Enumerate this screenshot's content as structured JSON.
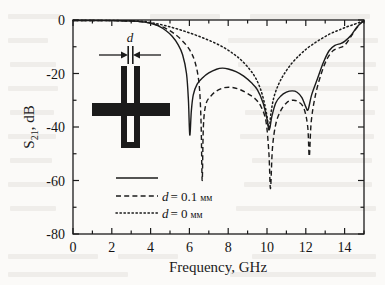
{
  "figure": {
    "background_color": "#fbfaf8",
    "ink_color": "#1b1b1b"
  },
  "axes": {
    "x_title": "Frequency, GHz",
    "y_title_main": "S",
    "y_title_sub": "21",
    "y_title_rest": ", dB",
    "x_ticks": [
      "0",
      "2",
      "4",
      "6",
      "8",
      "10",
      "12",
      "14"
    ],
    "y_ticks": [
      "0",
      "-20",
      "-40",
      "-60",
      "-80"
    ]
  },
  "legend": {
    "items": [
      {
        "style": "solid",
        "label": "",
        "units": ""
      },
      {
        "style": "dashed",
        "label": "d = 0.1",
        "units": "мм",
        "var": "d",
        "eq": "= 0.1"
      },
      {
        "style": "dotted",
        "label": "d = 0",
        "units": "мм",
        "var": "d",
        "eq": "= 0"
      }
    ]
  },
  "inset": {
    "dimension_label": "d",
    "description": "cross-shaped microstrip resonator with slot of width d"
  },
  "chart_data": {
    "type": "line",
    "title": "",
    "xlabel": "Frequency, GHz",
    "ylabel": "S21, dB",
    "xlim": [
      0,
      15
    ],
    "ylim": [
      -80,
      0
    ],
    "xticks": [
      0,
      2,
      4,
      6,
      8,
      10,
      12,
      14
    ],
    "yticks": [
      0,
      -20,
      -40,
      -60,
      -80
    ],
    "xminorticks": [
      1,
      3,
      5,
      7,
      9,
      11,
      13,
      15
    ],
    "yminorticks": [
      -10,
      -30,
      -50,
      -70
    ],
    "grid": false,
    "legend_position": "lower-left-inside",
    "series": [
      {
        "name": "solid",
        "label": "",
        "style": "solid",
        "points": [
          [
            0.0,
            -0.2
          ],
          [
            1.0,
            -0.2
          ],
          [
            2.0,
            -0.25
          ],
          [
            3.0,
            -0.4
          ],
          [
            3.5,
            -0.6
          ],
          [
            4.0,
            -1.2
          ],
          [
            4.4,
            -2.2
          ],
          [
            4.8,
            -4.0
          ],
          [
            5.1,
            -6.0
          ],
          [
            5.4,
            -9.0
          ],
          [
            5.65,
            -13.0
          ],
          [
            5.85,
            -20.0
          ],
          [
            5.95,
            -30.0
          ],
          [
            6.02,
            -43.0
          ],
          [
            6.1,
            -34.0
          ],
          [
            6.2,
            -28.0
          ],
          [
            6.4,
            -24.0
          ],
          [
            6.7,
            -21.5
          ],
          [
            7.0,
            -19.8
          ],
          [
            7.4,
            -18.4
          ],
          [
            7.7,
            -18.0
          ],
          [
            8.0,
            -18.3
          ],
          [
            8.4,
            -19.3
          ],
          [
            8.8,
            -21.0
          ],
          [
            9.2,
            -23.5
          ],
          [
            9.5,
            -26.0
          ],
          [
            9.8,
            -31.0
          ],
          [
            10.0,
            -37.0
          ],
          [
            10.12,
            -41.0
          ],
          [
            10.25,
            -36.0
          ],
          [
            10.45,
            -31.0
          ],
          [
            10.7,
            -28.5
          ],
          [
            11.0,
            -27.0
          ],
          [
            11.3,
            -26.5
          ],
          [
            11.55,
            -27.0
          ],
          [
            11.8,
            -29.0
          ],
          [
            12.0,
            -32.5
          ],
          [
            12.12,
            -33.5
          ],
          [
            12.3,
            -28.0
          ],
          [
            12.6,
            -22.0
          ],
          [
            12.9,
            -16.0
          ],
          [
            13.2,
            -11.5
          ],
          [
            13.5,
            -9.5
          ],
          [
            13.8,
            -8.8
          ],
          [
            14.0,
            -8.0
          ],
          [
            14.3,
            -6.0
          ],
          [
            14.6,
            -3.0
          ],
          [
            14.85,
            -1.0
          ],
          [
            15.0,
            -0.4
          ]
        ]
      },
      {
        "name": "dashed",
        "label": "d = 0.1 мм",
        "style": "dashed",
        "points": [
          [
            0.0,
            -0.2
          ],
          [
            1.5,
            -0.2
          ],
          [
            2.5,
            -0.3
          ],
          [
            3.3,
            -0.5
          ],
          [
            3.9,
            -1.0
          ],
          [
            4.3,
            -1.8
          ],
          [
            4.8,
            -3.2
          ],
          [
            5.2,
            -5.0
          ],
          [
            5.6,
            -7.5
          ],
          [
            6.0,
            -11.0
          ],
          [
            6.3,
            -16.0
          ],
          [
            6.5,
            -24.0
          ],
          [
            6.6,
            -38.0
          ],
          [
            6.66,
            -60.0
          ],
          [
            6.72,
            -40.0
          ],
          [
            6.85,
            -31.5
          ],
          [
            7.1,
            -28.5
          ],
          [
            7.4,
            -26.5
          ],
          [
            7.8,
            -25.3
          ],
          [
            8.2,
            -25.2
          ],
          [
            8.6,
            -26.0
          ],
          [
            9.0,
            -27.5
          ],
          [
            9.4,
            -29.5
          ],
          [
            9.7,
            -32.5
          ],
          [
            9.95,
            -38.0
          ],
          [
            10.1,
            -50.0
          ],
          [
            10.18,
            -63.0
          ],
          [
            10.28,
            -48.0
          ],
          [
            10.45,
            -39.0
          ],
          [
            10.7,
            -34.0
          ],
          [
            11.0,
            -31.0
          ],
          [
            11.3,
            -30.0
          ],
          [
            11.6,
            -30.5
          ],
          [
            11.9,
            -33.0
          ],
          [
            12.1,
            -40.0
          ],
          [
            12.18,
            -51.0
          ],
          [
            12.28,
            -38.0
          ],
          [
            12.5,
            -28.0
          ],
          [
            12.8,
            -20.0
          ],
          [
            13.1,
            -14.5
          ],
          [
            13.4,
            -11.5
          ],
          [
            13.7,
            -10.5
          ],
          [
            14.0,
            -9.5
          ],
          [
            14.3,
            -6.5
          ],
          [
            14.6,
            -3.2
          ],
          [
            14.85,
            -1.1
          ],
          [
            15.0,
            -0.4
          ]
        ]
      },
      {
        "name": "dotted",
        "label": "d = 0 мм",
        "style": "dotted",
        "points": [
          [
            0.0,
            -0.15
          ],
          [
            1.0,
            -0.15
          ],
          [
            2.0,
            -0.2
          ],
          [
            3.0,
            -0.3
          ],
          [
            3.6,
            -0.5
          ],
          [
            4.2,
            -1.2
          ],
          [
            4.8,
            -2.2
          ],
          [
            5.4,
            -3.4
          ],
          [
            6.0,
            -4.8
          ],
          [
            6.6,
            -6.4
          ],
          [
            7.2,
            -8.2
          ],
          [
            7.8,
            -10.4
          ],
          [
            8.3,
            -12.8
          ],
          [
            8.7,
            -15.2
          ],
          [
            9.1,
            -18.4
          ],
          [
            9.4,
            -21.5
          ],
          [
            9.65,
            -25.5
          ],
          [
            9.85,
            -30.5
          ],
          [
            10.0,
            -36.0
          ],
          [
            10.1,
            -41.0
          ],
          [
            10.2,
            -35.0
          ],
          [
            10.35,
            -29.0
          ],
          [
            10.6,
            -24.0
          ],
          [
            10.9,
            -20.0
          ],
          [
            11.3,
            -16.0
          ],
          [
            11.7,
            -13.0
          ],
          [
            12.1,
            -10.4
          ],
          [
            12.5,
            -8.4
          ],
          [
            12.9,
            -6.6
          ],
          [
            13.3,
            -5.0
          ],
          [
            13.7,
            -3.8
          ],
          [
            14.1,
            -2.6
          ],
          [
            14.5,
            -1.6
          ],
          [
            14.8,
            -0.8
          ],
          [
            15.0,
            -0.4
          ]
        ]
      }
    ]
  }
}
